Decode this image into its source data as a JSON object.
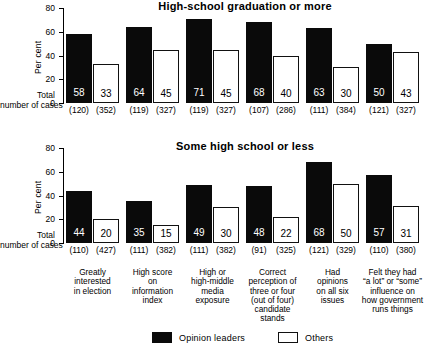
{
  "figure": {
    "total_label_line1": "Total",
    "total_label_line2": "number of cases",
    "y_axis_label": "Per cent",
    "y_ticks": [
      "80",
      "60",
      "40",
      "20",
      "0"
    ]
  },
  "legend": {
    "position": "bottom-center",
    "items": [
      {
        "key": "leader",
        "label": "Opinion leaders",
        "color": "#0a0a0a"
      },
      {
        "key": "other",
        "label": "Others",
        "color": "#ffffff"
      }
    ]
  },
  "categories_multiline": [
    [
      "Greatly",
      "interested",
      "in election"
    ],
    [
      "High score",
      "on",
      "information",
      "index"
    ],
    [
      "High or",
      "high-middle",
      "media",
      "exposure"
    ],
    [
      "Correct",
      "perception of",
      "three or four",
      "(out of four)",
      "candidate",
      "stands"
    ],
    [
      "Had",
      "opinions",
      "on all six",
      "issues"
    ],
    [
      "Felt they had",
      "“a lot” or “some”",
      "influence on",
      "how government",
      "runs things"
    ]
  ],
  "chart_data": [
    {
      "type": "bar",
      "title": "High-school graduation or more",
      "xlabel": "",
      "ylabel": "Per cent",
      "ylim": [
        0,
        80
      ],
      "yticks": [
        0,
        20,
        40,
        60,
        80
      ],
      "grid": false,
      "legend_position": "bottom-center",
      "categories": [
        "Greatly interested in election",
        "High score on information index",
        "High or high-middle media exposure",
        "Correct perception of three or four (out of four) candidate stands",
        "Had opinions on all six issues",
        "Felt they had “a lot” or “some” influence on how government runs things"
      ],
      "series": [
        {
          "name": "Opinion leaders",
          "color": "#0a0a0a",
          "values": [
            58,
            64,
            71,
            68,
            63,
            50
          ],
          "n": [
            120,
            119,
            119,
            107,
            111,
            121
          ]
        },
        {
          "name": "Others",
          "color": "#ffffff",
          "values": [
            33,
            45,
            45,
            40,
            30,
            43
          ],
          "n": [
            352,
            327,
            327,
            286,
            384,
            327
          ]
        }
      ],
      "n_labels": [
        [
          "(120)",
          "(352)"
        ],
        [
          "(119)",
          "(327)"
        ],
        [
          "(119)",
          "(327)"
        ],
        [
          "(107)",
          "(286)"
        ],
        [
          "(111)",
          "(384)"
        ],
        [
          "(121)",
          "(327)"
        ]
      ]
    },
    {
      "type": "bar",
      "title": "Some high school or less",
      "xlabel": "",
      "ylabel": "Per cent",
      "ylim": [
        0,
        80
      ],
      "yticks": [
        0,
        20,
        40,
        60,
        80
      ],
      "grid": false,
      "legend_position": "bottom-center",
      "categories": [
        "Greatly interested in election",
        "High score on information index",
        "High or high-middle media exposure",
        "Correct perception of three or four (out of four) candidate stands",
        "Had opinions on all six issues",
        "Felt they had “a lot” or “some” influence on how government runs things"
      ],
      "series": [
        {
          "name": "Opinion leaders",
          "color": "#0a0a0a",
          "values": [
            44,
            35,
            49,
            48,
            68,
            57
          ],
          "n": [
            110,
            111,
            111,
            91,
            121,
            110
          ]
        },
        {
          "name": "Others",
          "color": "#ffffff",
          "values": [
            20,
            15,
            30,
            22,
            50,
            31
          ],
          "n": [
            427,
            382,
            382,
            325,
            329,
            380
          ]
        }
      ],
      "n_labels": [
        [
          "(110)",
          "(427)"
        ],
        [
          "(111)",
          "(382)"
        ],
        [
          "(111)",
          "(382)"
        ],
        [
          "(91)",
          "(325)"
        ],
        [
          "(121)",
          "(329)"
        ],
        [
          "(110)",
          "(380)"
        ]
      ]
    }
  ]
}
